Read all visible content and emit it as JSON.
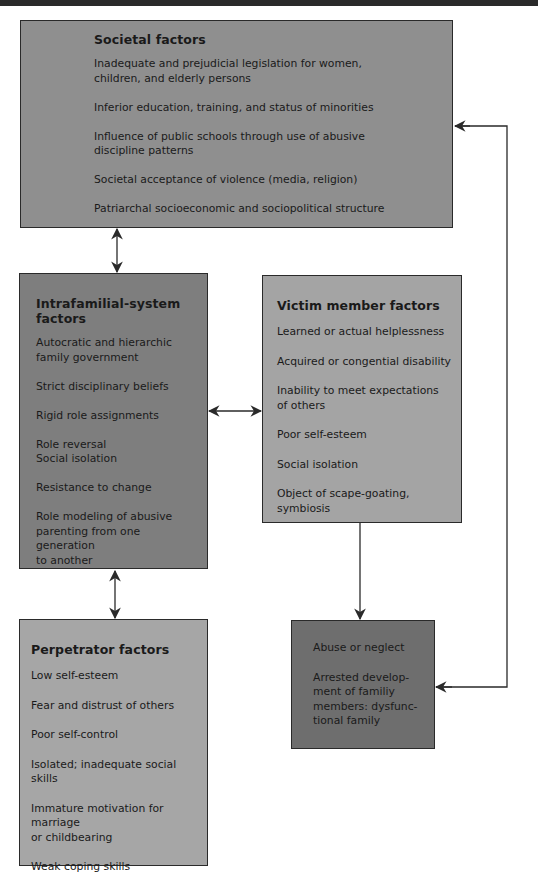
{
  "diagram": {
    "type": "flow-diagram",
    "boxes": {
      "societal": {
        "title": "Societal factors",
        "items": [
          "Inadequate and prejudicial legislation for women,\nchildren, and elderly persons",
          "Inferior education, training, and status of minorities",
          "Influence of public schools through use of abusive\ndiscipline patterns",
          "Societal acceptance of violence (media, religion)",
          "Patriarchal socioeconomic and sociopolitical structure"
        ]
      },
      "intrafamilial": {
        "title": "Intrafamilial-system factors",
        "items": [
          "Autocratic and hierarchic\nfamily government",
          "Strict disciplinary beliefs",
          "Rigid role assignments",
          "Role reversal\nSocial isolation",
          "Resistance to change",
          "Role modeling of abusive\nparenting from one generation\nto another"
        ]
      },
      "victim": {
        "title": "Victim member factors",
        "items": [
          "Learned or actual helplessness",
          "Acquired or congential disability",
          "Inability to meet expectations\nof others",
          "Poor self-esteem",
          "Social isolation",
          "Object of scape-goating, symbiosis"
        ]
      },
      "perpetrator": {
        "title": "Perpetrator factors",
        "items": [
          "Low self-esteem",
          "Fear and distrust of others",
          "Poor self-control",
          "Isolated; inadequate social skills",
          "Immature motivation for marriage\nor childbearing",
          "Weak coping skills"
        ]
      },
      "outcome": {
        "items": [
          "Abuse or neglect",
          "Arrested develop-\nment of familiy\nmembers: dysfunc-\ntional family"
        ]
      }
    },
    "connections": [
      {
        "from": "societal",
        "to": "intrafamilial",
        "type": "bidirectional"
      },
      {
        "from": "intrafamilial",
        "to": "victim",
        "type": "bidirectional"
      },
      {
        "from": "intrafamilial",
        "to": "perpetrator",
        "type": "bidirectional"
      },
      {
        "from": "victim",
        "to": "outcome",
        "type": "directed"
      },
      {
        "from": "outcome",
        "to": "societal",
        "type": "feedback-loop-bidirectional"
      }
    ],
    "colors": {
      "societal": "#8f8f8f",
      "intrafamilial": "#7e7e7e",
      "victim": "#a4a4a4",
      "perpetrator": "#a6a6a6",
      "outcome": "#6e6e6e",
      "line": "#2a2a2a"
    }
  }
}
